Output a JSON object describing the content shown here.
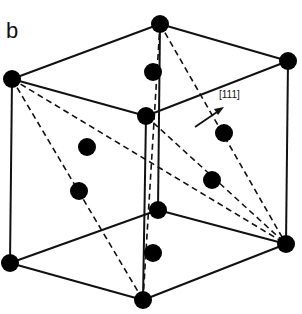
{
  "figure": {
    "panel_label": "b",
    "direction_label": "[111]",
    "colors": {
      "line": "#111111",
      "atom": "#000000",
      "background": "#ffffff"
    }
  },
  "atoms": [
    {
      "id": "top-left",
      "x": 12,
      "y": 79
    },
    {
      "id": "top-back",
      "x": 160,
      "y": 24
    },
    {
      "id": "top-right",
      "x": 288,
      "y": 61
    },
    {
      "id": "top-front",
      "x": 146,
      "y": 116
    },
    {
      "id": "bottom-left",
      "x": 10,
      "y": 263
    },
    {
      "id": "bottom-right",
      "x": 286,
      "y": 244
    },
    {
      "id": "bottom-front",
      "x": 143,
      "y": 300
    },
    {
      "id": "bottom-back",
      "x": 158,
      "y": 210
    },
    {
      "id": "inner-1",
      "x": 153,
      "y": 72
    },
    {
      "id": "inner-2",
      "x": 87,
      "y": 147
    },
    {
      "id": "inner-3",
      "x": 224,
      "y": 133
    },
    {
      "id": "inner-4",
      "x": 79,
      "y": 191
    },
    {
      "id": "inner-5",
      "x": 212,
      "y": 180
    },
    {
      "id": "inner-6",
      "x": 153,
      "y": 253
    }
  ]
}
